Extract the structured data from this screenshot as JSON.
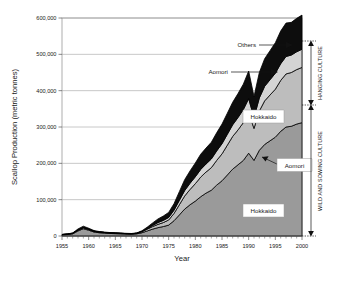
{
  "chart_data": {
    "type": "area",
    "stacked": true,
    "title": "",
    "xlabel": "Year",
    "ylabel": "Scallop Production (metric tonnes)",
    "xlim": [
      1955,
      2000
    ],
    "ylim": [
      0,
      600000
    ],
    "xticks": [
      1955,
      1960,
      1965,
      1970,
      1975,
      1980,
      1985,
      1990,
      1995,
      2000
    ],
    "xtick_labels": [
      "1955",
      "1960",
      "1965",
      "1970",
      "1975",
      "1980",
      "1985",
      "1990",
      "1995",
      "2000"
    ],
    "minor_xtick_interval": 1,
    "yticks": [
      0,
      100000,
      200000,
      300000,
      400000,
      500000,
      600000
    ],
    "ytick_labels": [
      "0",
      "100,000",
      "200,000",
      "300,000",
      "400,000",
      "500,000",
      "600,000"
    ],
    "grid": "horizontal",
    "legend_position": "inline-annotations",
    "x": [
      1955,
      1956,
      1957,
      1958,
      1959,
      1960,
      1961,
      1962,
      1963,
      1964,
      1965,
      1966,
      1967,
      1968,
      1969,
      1970,
      1971,
      1972,
      1973,
      1974,
      1975,
      1976,
      1977,
      1978,
      1979,
      1980,
      1981,
      1982,
      1983,
      1984,
      1985,
      1986,
      1987,
      1988,
      1989,
      1990,
      1991,
      1992,
      1993,
      1994,
      1995,
      1996,
      1997,
      1998,
      1999,
      2000
    ],
    "series": [
      {
        "name": "Hokkaido",
        "culture": "Wild and sowing culture",
        "fill_color": "#9a9a9a",
        "order": 1,
        "values": [
          3000,
          4000,
          6000,
          14000,
          20000,
          16000,
          11000,
          9000,
          8000,
          7000,
          6500,
          6000,
          5500,
          5000,
          6000,
          9000,
          14000,
          19000,
          23000,
          26000,
          30000,
          42000,
          58000,
          74000,
          86000,
          96000,
          108000,
          118000,
          126000,
          140000,
          152000,
          168000,
          184000,
          196000,
          208000,
          228000,
          208000,
          236000,
          252000,
          262000,
          272000,
          288000,
          300000,
          302000,
          308000,
          312000
        ]
      },
      {
        "name": "Aomori",
        "culture": "Wild and sowing culture",
        "fill_color": "#bdbdbd",
        "order": 2,
        "values": [
          1000,
          1200,
          1500,
          2500,
          3000,
          2500,
          2000,
          1800,
          1600,
          1500,
          1400,
          1300,
          1200,
          1200,
          1500,
          3000,
          5000,
          7000,
          9000,
          11000,
          14000,
          20000,
          28000,
          36000,
          42000,
          48000,
          54000,
          58000,
          62000,
          68000,
          74000,
          82000,
          90000,
          96000,
          104000,
          112000,
          88000,
          108000,
          120000,
          126000,
          132000,
          140000,
          146000,
          148000,
          150000,
          152000
        ]
      },
      {
        "name": "Hokkaido",
        "culture": "Hanging culture",
        "fill_color": "#d4d4d4",
        "order": 3,
        "values": [
          0,
          0,
          0,
          0,
          0,
          0,
          0,
          0,
          0,
          0,
          0,
          0,
          0,
          0,
          0,
          500,
          1500,
          3000,
          5000,
          6000,
          7000,
          9000,
          12000,
          15000,
          17000,
          19000,
          21000,
          22000,
          24000,
          26000,
          28000,
          30000,
          32000,
          34000,
          36000,
          38000,
          30000,
          36000,
          40000,
          42000,
          44000,
          46000,
          48000,
          48000,
          49000,
          50000
        ]
      },
      {
        "name": "Others",
        "culture": "Hanging culture",
        "fill_color": "#0d0d0d",
        "order": 4,
        "values": [
          500,
          600,
          800,
          3000,
          4000,
          3000,
          2000,
          1500,
          1200,
          1000,
          900,
          800,
          700,
          700,
          900,
          2000,
          4000,
          7000,
          10000,
          12000,
          14000,
          18000,
          24000,
          30000,
          34000,
          38000,
          42000,
          44000,
          46000,
          50000,
          54000,
          58000,
          62000,
          66000,
          70000,
          76000,
          58000,
          70000,
          76000,
          80000,
          84000,
          90000,
          92000,
          90000,
          92000,
          94000
        ]
      }
    ],
    "annotations": [
      {
        "id": "others-label",
        "text": "Others",
        "kind": "leader-arrow"
      },
      {
        "id": "aomori-top-label",
        "text": "Aomori",
        "kind": "leader-arrow"
      },
      {
        "id": "hokkaido-top-label",
        "text": "Hokkaido",
        "kind": "boxed"
      },
      {
        "id": "aomori-bottom-label",
        "text": "Aomori",
        "kind": "boxed-leader"
      },
      {
        "id": "hokkaido-bottom-label",
        "text": "Hokkaido",
        "kind": "boxed"
      }
    ],
    "brackets": [
      {
        "id": "hanging-culture",
        "label": "HANGING CULTURE",
        "from": 360000,
        "to": 600000
      },
      {
        "id": "wild-sowing-culture",
        "label": "WILD AND SOWING CULTURE",
        "from": 0,
        "to": 360000
      }
    ]
  }
}
